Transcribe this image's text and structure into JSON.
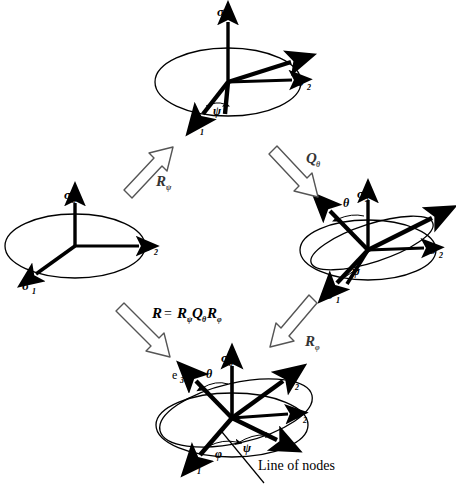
{
  "figure": {
    "type": "euler-angle-rotation-diagram",
    "background": "#ffffff",
    "ink": "#000000",
    "caption_text": "Line of nodes"
  },
  "frames": [
    {
      "id": "frame-initial",
      "position": "left",
      "axes": [
        {
          "name": "sigma-3-axis",
          "label": "σ",
          "subscript": "3"
        },
        {
          "name": "sigma-2-axis",
          "label": "σ",
          "subscript": "2"
        },
        {
          "name": "sigma-1-axis",
          "label": "σ",
          "subscript": "1"
        }
      ],
      "angles": []
    },
    {
      "id": "frame-psi",
      "position": "top",
      "axes": [
        {
          "name": "sigma-3-axis",
          "label": "σ",
          "subscript": "3"
        },
        {
          "name": "sigma-2-axis",
          "label": "σ",
          "subscript": "2"
        },
        {
          "name": "sigma-1-axis",
          "label": "σ",
          "subscript": "1"
        }
      ],
      "angles": [
        {
          "name": "psi-angle",
          "label": "ψ"
        }
      ]
    },
    {
      "id": "frame-theta",
      "position": "right",
      "axes": [
        {
          "name": "sigma-3-axis",
          "label": "σ",
          "subscript": "3"
        },
        {
          "name": "sigma-2-axis",
          "label": "σ",
          "subscript": "2"
        },
        {
          "name": "sigma-1-axis",
          "label": "σ",
          "subscript": "1"
        }
      ],
      "angles": [
        {
          "name": "theta-angle",
          "label": "θ"
        },
        {
          "name": "psi-angle",
          "label": "ψ"
        }
      ]
    },
    {
      "id": "frame-final",
      "position": "bottom",
      "axes": [
        {
          "name": "sigma-3-axis",
          "label": "σ",
          "subscript": "3"
        },
        {
          "name": "sigma-2-axis",
          "label": "σ",
          "subscript": "2"
        },
        {
          "name": "sigma-1-axis",
          "label": "σ",
          "subscript": "1"
        },
        {
          "name": "e-1-axis",
          "label": "e",
          "subscript": "1"
        },
        {
          "name": "e-2-axis",
          "label": "e",
          "subscript": "2"
        },
        {
          "name": "e-3-axis",
          "label": "e",
          "subscript": "3"
        }
      ],
      "angles": [
        {
          "name": "theta-angle",
          "label": "θ"
        },
        {
          "name": "psi-angle",
          "label": "ψ"
        },
        {
          "name": "phi-angle",
          "label": "φ"
        }
      ],
      "annotation": "Line of nodes"
    }
  ],
  "operators": {
    "r_psi": {
      "base": "R",
      "sub": "ψ"
    },
    "q_theta": {
      "base": "Q",
      "sub": "θ"
    },
    "r_phi": {
      "base": "R",
      "sub": "φ"
    },
    "composition": {
      "lhs": "R",
      "equals": "=",
      "t1": "R",
      "t1sub": "ψ",
      "t2": "Q",
      "t2sub": "θ",
      "t3": "R",
      "t3sub": "φ"
    }
  },
  "labels": {
    "sigma": "σ",
    "e": "e",
    "s1": "1",
    "s2": "2",
    "s3": "3",
    "psi": "ψ",
    "theta": "θ",
    "phi": "φ",
    "line_of_nodes": "Line of nodes"
  }
}
